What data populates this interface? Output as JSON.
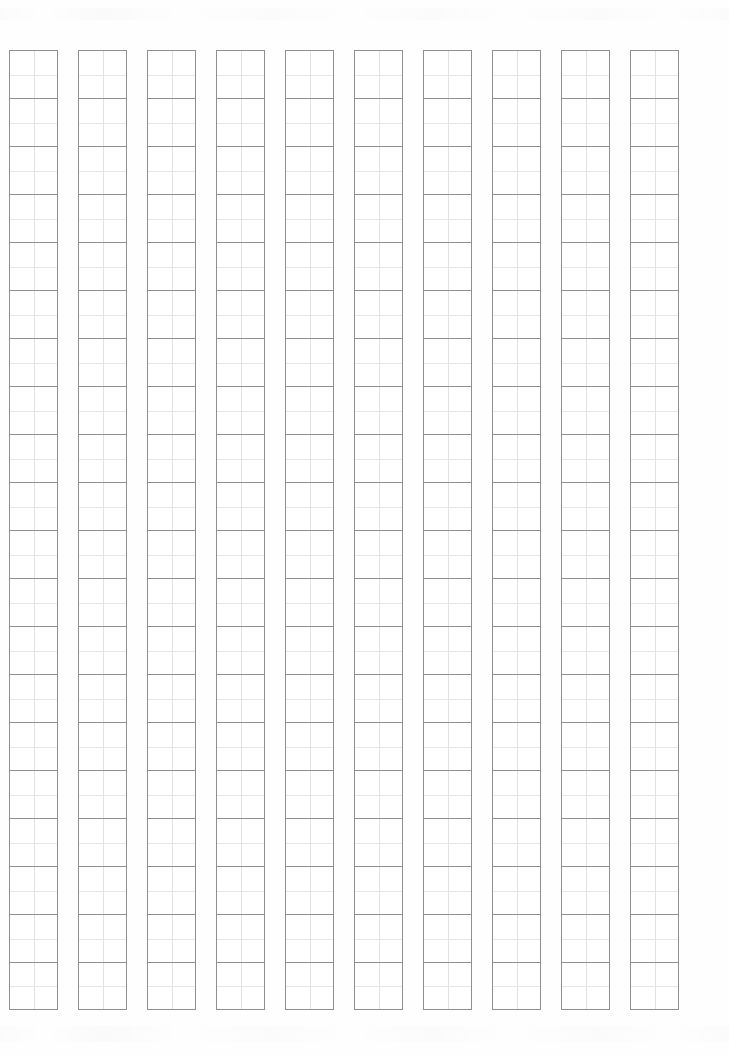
{
  "page": {
    "paper_color": "#fefefe",
    "width_px": 729,
    "height_px": 1056
  },
  "grid": {
    "label": "genko-yoshi-writing-grid",
    "orientation": "vertical-columns-right-to-left",
    "column_count": 10,
    "rows_per_column": 20,
    "total_cells": 200,
    "cell_width_px": 49,
    "cell_height_px": 48,
    "column_gap_px": 20,
    "origin_x_px": 9,
    "origin_y_px": 50,
    "cell_border_color": "#8f8f8f",
    "cell_guide_color": "#e2e2e2",
    "cell_contents": [
      [
        "",
        "",
        "",
        "",
        "",
        "",
        "",
        "",
        "",
        "",
        "",
        "",
        "",
        "",
        "",
        "",
        "",
        "",
        "",
        ""
      ],
      [
        "",
        "",
        "",
        "",
        "",
        "",
        "",
        "",
        "",
        "",
        "",
        "",
        "",
        "",
        "",
        "",
        "",
        "",
        "",
        ""
      ],
      [
        "",
        "",
        "",
        "",
        "",
        "",
        "",
        "",
        "",
        "",
        "",
        "",
        "",
        "",
        "",
        "",
        "",
        "",
        "",
        ""
      ],
      [
        "",
        "",
        "",
        "",
        "",
        "",
        "",
        "",
        "",
        "",
        "",
        "",
        "",
        "",
        "",
        "",
        "",
        "",
        "",
        ""
      ],
      [
        "",
        "",
        "",
        "",
        "",
        "",
        "",
        "",
        "",
        "",
        "",
        "",
        "",
        "",
        "",
        "",
        "",
        "",
        "",
        ""
      ],
      [
        "",
        "",
        "",
        "",
        "",
        "",
        "",
        "",
        "",
        "",
        "",
        "",
        "",
        "",
        "",
        "",
        "",
        "",
        "",
        ""
      ],
      [
        "",
        "",
        "",
        "",
        "",
        "",
        "",
        "",
        "",
        "",
        "",
        "",
        "",
        "",
        "",
        "",
        "",
        "",
        "",
        ""
      ],
      [
        "",
        "",
        "",
        "",
        "",
        "",
        "",
        "",
        "",
        "",
        "",
        "",
        "",
        "",
        "",
        "",
        "",
        "",
        "",
        ""
      ],
      [
        "",
        "",
        "",
        "",
        "",
        "",
        "",
        "",
        "",
        "",
        "",
        "",
        "",
        "",
        "",
        "",
        "",
        "",
        "",
        ""
      ],
      [
        "",
        "",
        "",
        "",
        "",
        "",
        "",
        "",
        "",
        "",
        "",
        "",
        "",
        "",
        "",
        "",
        "",
        "",
        "",
        ""
      ]
    ]
  }
}
